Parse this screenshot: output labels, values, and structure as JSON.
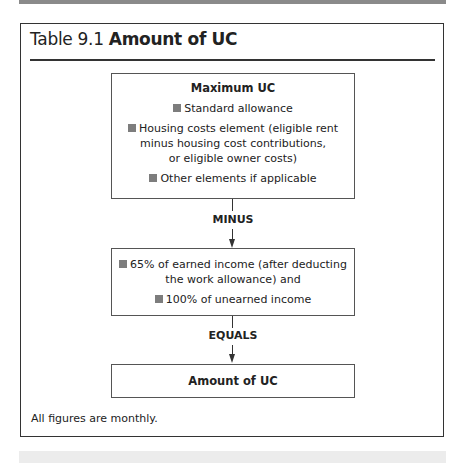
{
  "title": {
    "prefix": "Table 9.1",
    "bold": "Amount of UC"
  },
  "diagram": {
    "box1": {
      "heading": "Maximum UC",
      "items": [
        "Standard allowance",
        "Housing costs element (eligible rent minus housing cost contributions, or eligible owner costs)",
        "Other elements if applicable"
      ],
      "item2_lines": [
        "Housing costs element (eligible rent",
        "minus housing cost contributions,",
        "or eligible owner costs)"
      ]
    },
    "op1": "MINUS",
    "box2": {
      "item1_lines": [
        "65% of earned income (after deducting",
        "the work allowance) and"
      ],
      "item2": "100% of unearned income"
    },
    "op2": "EQUALS",
    "box3": {
      "heading": "Amount of UC"
    },
    "bullet_icon": "gray-square-bullet",
    "colors": {
      "bullet": "#7d7d7d",
      "border": "#333333"
    }
  },
  "note": "All figures are monthly."
}
